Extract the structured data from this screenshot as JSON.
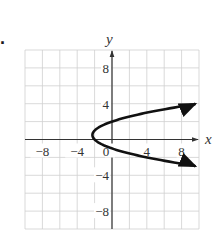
{
  "problem_number": "8.",
  "chart_data": {
    "type": "line",
    "title": "",
    "xlabel": "x",
    "ylabel": "y",
    "xlim": [
      -10,
      10
    ],
    "ylim": [
      -10,
      10
    ],
    "grid": true,
    "grid_step": 2,
    "x_ticks": [
      {
        "value": -8,
        "label": "−8"
      },
      {
        "value": -4,
        "label": "−4"
      },
      {
        "value": 0,
        "label": "0"
      },
      {
        "value": 4,
        "label": "4"
      },
      {
        "value": 8,
        "label": "8"
      }
    ],
    "y_ticks": [
      {
        "value": 8,
        "label": "8"
      },
      {
        "value": 4,
        "label": "4"
      },
      {
        "value": -4,
        "label": "−4"
      },
      {
        "value": -8,
        "label": "−8"
      }
    ],
    "series": [
      {
        "name": "parabola x = y^2 - y - 2",
        "description": "Horizontal parabola opening right, vertex near (-2.25, 0.5), arrows on both ends",
        "vertex": [
          -2.25,
          0.5
        ],
        "points": [
          [
            9.8,
            4.0
          ],
          [
            6.0,
            3.5
          ],
          [
            3.0,
            2.8
          ],
          [
            0,
            2.0
          ],
          [
            -1.25,
            1.5
          ],
          [
            -2.0,
            1.0
          ],
          [
            -2.25,
            0.5
          ],
          [
            -2.0,
            0.0
          ],
          [
            -1.25,
            -0.5
          ],
          [
            0,
            -1.0
          ],
          [
            3.0,
            -1.8
          ],
          [
            6.0,
            -2.5
          ],
          [
            9.8,
            -3.0
          ]
        ],
        "arrows": "both"
      }
    ],
    "colors": {
      "grid": "#cfcfcf",
      "axes": "#333333",
      "curve": "#111111"
    }
  }
}
